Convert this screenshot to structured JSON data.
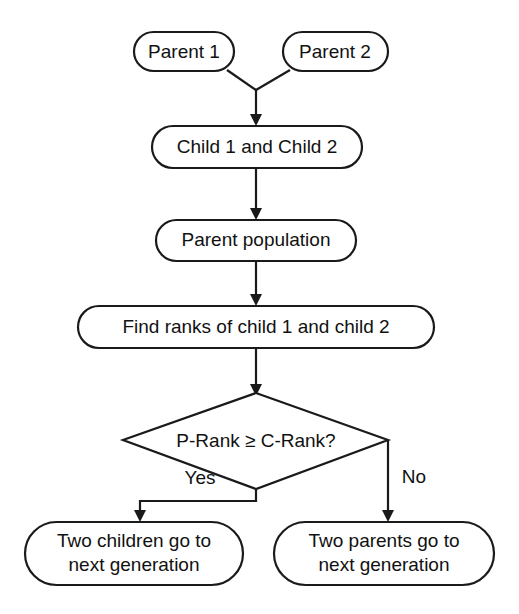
{
  "diagram": {
    "type": "flowchart",
    "title": "",
    "background_color": "#ffffff",
    "line_color": "#1a1a1a",
    "text_color": "#111111",
    "nodes": [
      {
        "id": "parent1",
        "shape": "rounded-rectangle",
        "label": "Parent 1"
      },
      {
        "id": "parent2",
        "shape": "rounded-rectangle",
        "label": "Parent 2"
      },
      {
        "id": "children",
        "shape": "rounded-rectangle",
        "label": "Child 1 and Child 2"
      },
      {
        "id": "population",
        "shape": "rounded-rectangle",
        "label": "Parent population"
      },
      {
        "id": "findranks",
        "shape": "rounded-rectangle",
        "label": "Find ranks of child 1 and child 2"
      },
      {
        "id": "decision",
        "shape": "diamond",
        "label": "P-Rank ≥ C-Rank?"
      },
      {
        "id": "childrenwin",
        "shape": "rounded-rectangle",
        "label_line1": "Two children go to",
        "label_line2": "next generation"
      },
      {
        "id": "parentswin",
        "shape": "rounded-rectangle",
        "label_line1": "Two parents go to",
        "label_line2": "next generation"
      }
    ],
    "edge_labels": {
      "yes": "Yes",
      "no": "No"
    }
  }
}
